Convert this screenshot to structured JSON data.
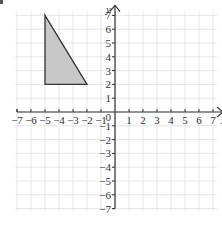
{
  "diagram": {
    "type": "coordinate_grid",
    "x_axis": {
      "label": "x",
      "min": -7,
      "max": 7,
      "tick_labels": [
        "−7",
        "−6",
        "−5",
        "−4",
        "−3",
        "−2",
        "−1",
        "1",
        "2",
        "3",
        "4",
        "5",
        "6",
        "7"
      ]
    },
    "y_axis": {
      "label": "y",
      "min": -7,
      "max": 7,
      "tick_labels": [
        "7",
        "6",
        "5",
        "4",
        "3",
        "2",
        "1",
        "−1",
        "−2",
        "−3",
        "−4",
        "−5",
        "−6",
        "−7"
      ]
    },
    "origin_label": "0",
    "grid": true,
    "shape": {
      "name": "triangle",
      "vertices": [
        [
          -5,
          7
        ],
        [
          -5,
          2
        ],
        [
          -2,
          2
        ]
      ],
      "fill": "#c8c8c8",
      "stroke": "#333333"
    },
    "colors": {
      "grid": "#e6e6e6",
      "axis": "#333333"
    }
  }
}
